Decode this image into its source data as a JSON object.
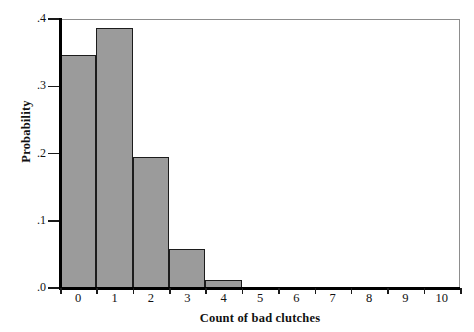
{
  "chart_data": {
    "type": "bar",
    "title": "",
    "subtitle": "",
    "xlabel": "Count of bad clutches",
    "ylabel": "Probability",
    "categories": [
      "0",
      "1",
      "2",
      "3",
      "4",
      "5",
      "6",
      "7",
      "8",
      "9",
      "10"
    ],
    "values": [
      0.347,
      0.387,
      0.195,
      0.058,
      0.012,
      0.002,
      0.0,
      0.0,
      0.0,
      0.0,
      0.0
    ],
    "xlim": [
      0,
      11
    ],
    "ylim": [
      0.0,
      0.4
    ],
    "xticks": [
      "0",
      "1",
      "2",
      "3",
      "4",
      "5",
      "6",
      "7",
      "8",
      "9",
      "10"
    ],
    "yticks": [
      ".0",
      ".1",
      ".2",
      ".3",
      ".4"
    ],
    "ytick_values": [
      0.0,
      0.1,
      0.2,
      0.3,
      0.4
    ],
    "grid": false,
    "legend": false,
    "legend_position": "none",
    "bar_fill_color": "#9b9b9b",
    "bar_edge_color": "#1c1c1c",
    "axis_color": "#000000",
    "frame_color": "#8d8d8d",
    "background_color": "#ffffff",
    "annotations": []
  },
  "axes": {
    "y": {
      "title": "Probability",
      "ticks": [
        {
          "label": ".0",
          "value": 0.0
        },
        {
          "label": ".1",
          "value": 0.1
        },
        {
          "label": ".2",
          "value": 0.2
        },
        {
          "label": ".3",
          "value": 0.3
        },
        {
          "label": ".4",
          "value": 0.4
        }
      ]
    },
    "x": {
      "title": "Count of bad clutches",
      "ticks": [
        {
          "label": "0",
          "value": 0
        },
        {
          "label": "1",
          "value": 1
        },
        {
          "label": "2",
          "value": 2
        },
        {
          "label": "3",
          "value": 3
        },
        {
          "label": "4",
          "value": 4
        },
        {
          "label": "5",
          "value": 5
        },
        {
          "label": "6",
          "value": 6
        },
        {
          "label": "7",
          "value": 7
        },
        {
          "label": "8",
          "value": 8
        },
        {
          "label": "9",
          "value": 9
        },
        {
          "label": "10",
          "value": 10
        }
      ]
    }
  }
}
